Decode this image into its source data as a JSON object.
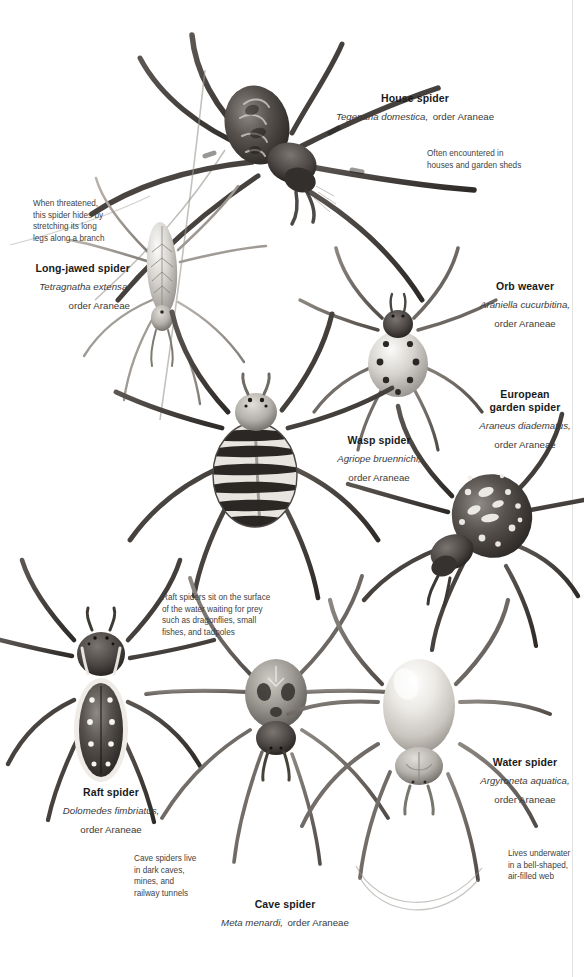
{
  "page": {
    "background_color": "#ffffff",
    "ink_color": "#231f20"
  },
  "species": [
    {
      "id": "house-spider",
      "common_name": "House spider",
      "latin_name": "Tegenaria domestica,",
      "order": "order Araneae",
      "note": "Often encountered in\nhouses and garden sheds",
      "body_style": "dark mottled abdomen, long hairy legs"
    },
    {
      "id": "long-jawed-spider",
      "common_name": "Long-jawed spider",
      "latin_name": "Tetragnatha extensa,",
      "order": "order Araneae",
      "note": "When threatened,\nthis spider hides by\nstretching its long\nlegs along a branch",
      "body_style": "slender elongated pale abdomen"
    },
    {
      "id": "orb-weaver",
      "common_name": "Orb weaver",
      "latin_name": "Araniella cucurbitina,",
      "order": "order Araneae",
      "note": "",
      "body_style": "pale round abdomen with black dots"
    },
    {
      "id": "european-garden-spider",
      "common_name": "European\ngarden spider",
      "latin_name": "Araneus diadematus,",
      "order": "order Araneae",
      "note": "",
      "body_style": "dark abdomen with white cross markings"
    },
    {
      "id": "wasp-spider",
      "common_name": "Wasp spider",
      "latin_name": "Agriope bruennichi,",
      "order": "order Araneae",
      "note": "",
      "body_style": "black and white banded abdomen"
    },
    {
      "id": "raft-spider",
      "common_name": "Raft spider",
      "latin_name": "Dolomedes fimbriatus,",
      "order": "order Araneae",
      "note": "Raft spiders sit on the surface\nof the water waiting for prey\nsuch as dragonflies, small\nfishes, and tadpoles",
      "body_style": "dark abdomen, white side stripes and paired spots"
    },
    {
      "id": "cave-spider",
      "common_name": "Cave spider",
      "latin_name": "Meta menardi,",
      "order": "order Araneae",
      "note": "Cave spiders live\nin dark caves,\nmines, and\nrailway tunnels",
      "body_style": "mottled grey abdomen, long legs"
    },
    {
      "id": "water-spider",
      "common_name": "Water spider",
      "latin_name": "Argyroneta aquatica,",
      "order": "order Araneae",
      "note": "Lives underwater\nin a bell-shaped,\nair-filled web",
      "body_style": "pale silvery smooth oval abdomen"
    }
  ]
}
